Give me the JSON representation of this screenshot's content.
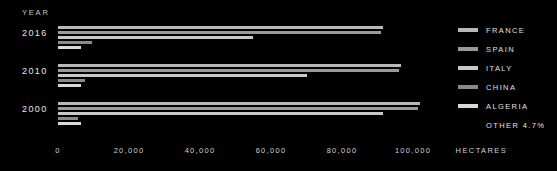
{
  "axis_title_year": "YEAR",
  "unit_label": "HECTARES",
  "legend": {
    "items": [
      {
        "label": "FRANCE",
        "color": "#b8b8b8"
      },
      {
        "label": "SPAIN",
        "color": "#9a9a9a"
      },
      {
        "label": "ITALY",
        "color": "#c8c8c8"
      },
      {
        "label": "CHINA",
        "color": "#8a8a8a"
      },
      {
        "label": "ALGERIA",
        "color": "#d8d8d8"
      }
    ],
    "other_label": "OTHER 4.7%"
  },
  "chart_data": {
    "type": "bar",
    "orientation": "horizontal",
    "title": "",
    "xlabel": "HECTARES",
    "ylabel": "YEAR",
    "xlim": [
      0,
      110000
    ],
    "grid": false,
    "legend_position": "right",
    "categories": [
      "2016",
      "2010",
      "2000"
    ],
    "tick_labels": [
      "0",
      "20,000",
      "40,000",
      "60,000",
      "80,000",
      "100,000"
    ],
    "tick_values": [
      0,
      20000,
      40000,
      60000,
      80000,
      100000
    ],
    "series": [
      {
        "name": "FRANCE",
        "color": "#b8b8b8",
        "values": [
          91500,
          96500,
          102000
        ]
      },
      {
        "name": "SPAIN",
        "color": "#9a9a9a",
        "values": [
          91000,
          96000,
          101500
        ]
      },
      {
        "name": "ITALY",
        "color": "#c8c8c8",
        "values": [
          55000,
          70000,
          91500
        ]
      },
      {
        "name": "CHINA",
        "color": "#8a8a8a",
        "values": [
          9500,
          7500,
          5500
        ]
      },
      {
        "name": "ALGERIA",
        "color": "#d8d8d8",
        "values": [
          6500,
          6500,
          6500
        ]
      }
    ],
    "annotations": [
      "OTHER 4.7%"
    ]
  }
}
